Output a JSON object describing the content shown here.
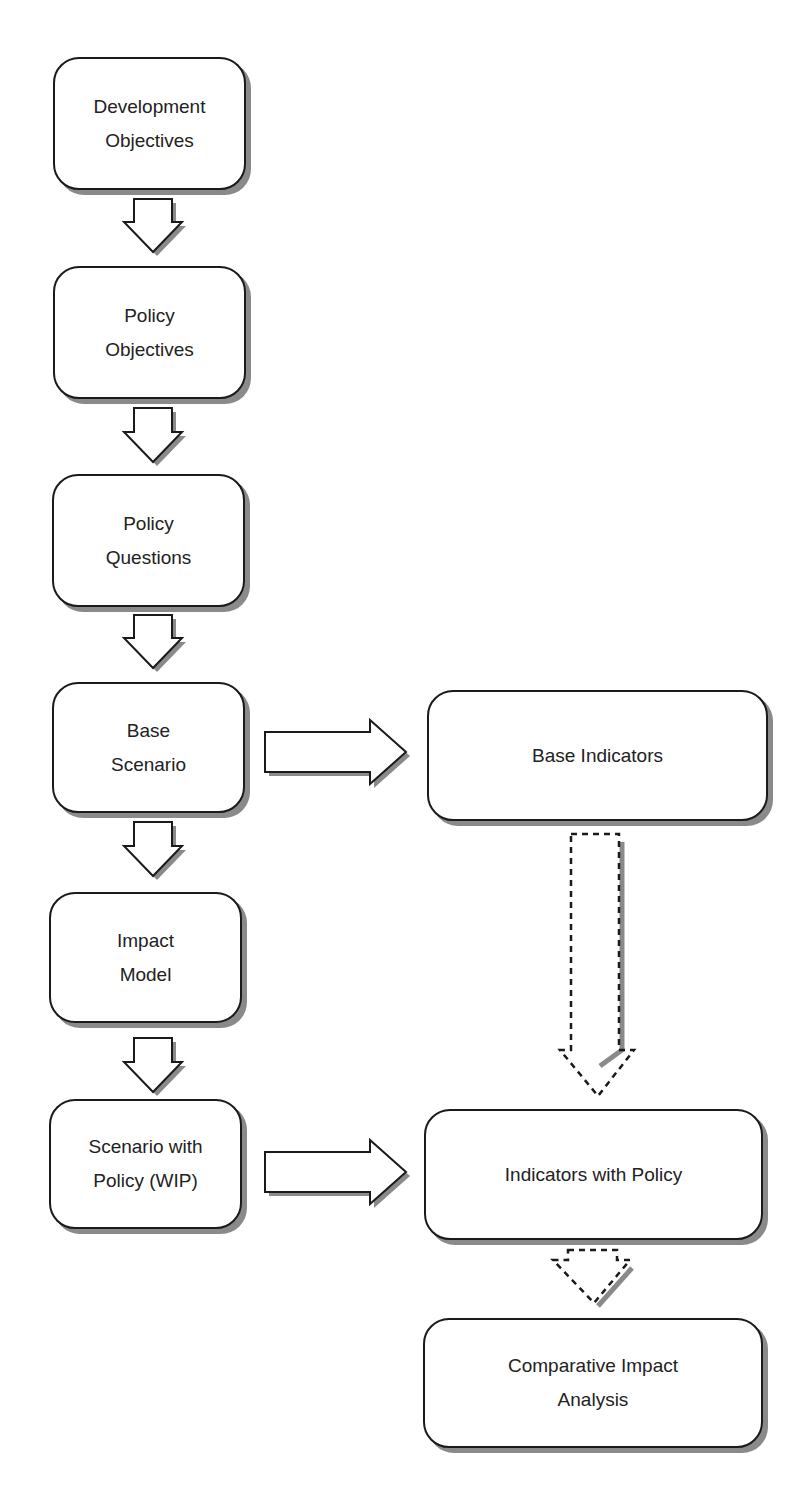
{
  "diagram": {
    "type": "flowchart",
    "nodes": [
      {
        "id": "development-objectives",
        "label": "Development\nObjectives"
      },
      {
        "id": "policy-objectives",
        "label": "Policy\nObjectives"
      },
      {
        "id": "policy-questions",
        "label": "Policy\nQuestions"
      },
      {
        "id": "base-scenario",
        "label": "Base\nScenario"
      },
      {
        "id": "impact-model",
        "label": "Impact\nModel"
      },
      {
        "id": "scenario-with-policy",
        "label": "Scenario with\nPolicy (WIP)"
      },
      {
        "id": "base-indicators",
        "label": "Base Indicators"
      },
      {
        "id": "indicators-with-policy",
        "label": "Indicators with Policy"
      },
      {
        "id": "comparative-impact-analysis",
        "label": "Comparative Impact\nAnalysis"
      }
    ],
    "edges": [
      {
        "from": "development-objectives",
        "to": "policy-objectives",
        "style": "solid"
      },
      {
        "from": "policy-objectives",
        "to": "policy-questions",
        "style": "solid"
      },
      {
        "from": "policy-questions",
        "to": "base-scenario",
        "style": "solid"
      },
      {
        "from": "base-scenario",
        "to": "impact-model",
        "style": "solid"
      },
      {
        "from": "impact-model",
        "to": "scenario-with-policy",
        "style": "solid"
      },
      {
        "from": "base-scenario",
        "to": "base-indicators",
        "style": "solid"
      },
      {
        "from": "scenario-with-policy",
        "to": "indicators-with-policy",
        "style": "solid"
      },
      {
        "from": "base-indicators",
        "to": "indicators-with-policy",
        "style": "dashed"
      },
      {
        "from": "indicators-with-policy",
        "to": "comparative-impact-analysis",
        "style": "dashed"
      }
    ]
  }
}
